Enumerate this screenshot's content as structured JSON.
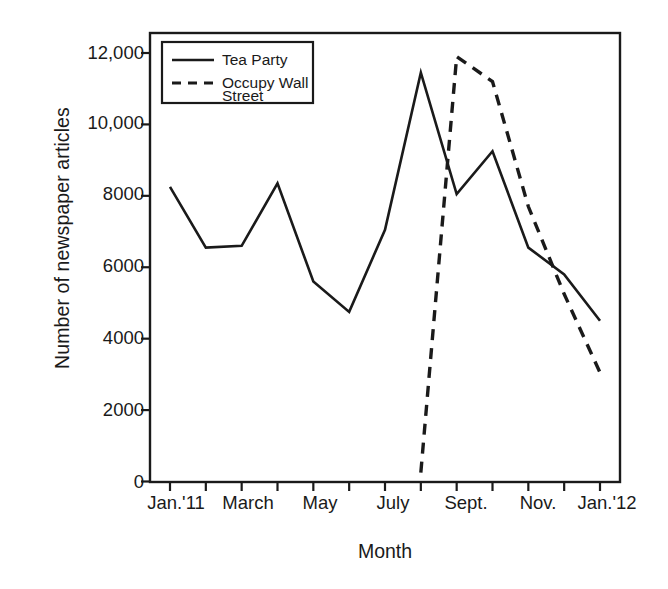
{
  "chart_data": {
    "type": "line",
    "title": "",
    "xlabel": "Month",
    "ylabel": "Number of newspaper articles",
    "x": [
      "Jan.'11",
      "Feb.",
      "March",
      "April",
      "May",
      "June",
      "July",
      "Aug.",
      "Sept.",
      "Oct.",
      "Nov.",
      "Dec.",
      "Jan.'12"
    ],
    "x_tick_labels": [
      "Jan.'11",
      "March",
      "May",
      "July",
      "Sept.",
      "Nov.",
      "Jan.'12"
    ],
    "x_tick_label_positions": [
      0,
      2,
      4,
      6,
      8,
      10,
      12
    ],
    "y_tick_labels": [
      "0",
      "2000",
      "4000",
      "6000",
      "8000",
      "10,000",
      "12,000"
    ],
    "y_tick_values": [
      0,
      2000,
      4000,
      6000,
      8000,
      10000,
      12000
    ],
    "ylim": [
      0,
      12600
    ],
    "grid": false,
    "legend_position": "top-left",
    "series": [
      {
        "name": "Tea Party",
        "style": "solid",
        "color": "#1a1a1a",
        "values": [
          8250,
          6550,
          6600,
          8350,
          5600,
          4750,
          7050,
          11450,
          8050,
          9250,
          6550,
          5800,
          4500
        ]
      },
      {
        "name": "Occupy Wall Street",
        "style": "dashed",
        "color": "#1a1a1a",
        "values": [
          null,
          null,
          null,
          null,
          null,
          null,
          null,
          250,
          11900,
          11200,
          7700,
          5250,
          3050
        ]
      }
    ]
  },
  "legend": {
    "entries": [
      {
        "label": "Tea Party",
        "style": "solid"
      },
      {
        "label": "Occupy Wall Street",
        "style": "dashed",
        "line1": "Occupy Wall",
        "line2": "Street"
      }
    ]
  },
  "axes": {
    "y_title": "Number of newspaper articles",
    "x_title": "Month"
  }
}
